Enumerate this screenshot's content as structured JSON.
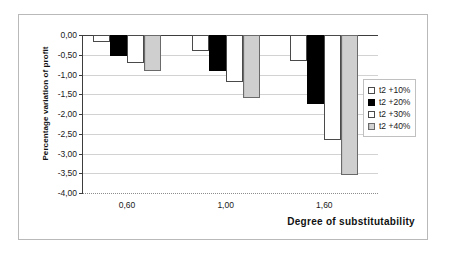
{
  "chart_data": {
    "type": "bar",
    "title": "",
    "xlabel": "Degree of substitutability",
    "ylabel": "Percentage variation of profit",
    "categories": [
      "0,60",
      "1,00",
      "1,60"
    ],
    "ylim": [
      -4.0,
      0.0
    ],
    "ytick_labels": [
      "0,00",
      "-0,50",
      "-1,00",
      "-1,50",
      "-2,00",
      "-2,50",
      "-3,00",
      "-3,50",
      "-4,00"
    ],
    "ytick_values": [
      0.0,
      -0.5,
      -1.0,
      -1.5,
      -2.0,
      -2.5,
      -3.0,
      -3.5,
      -4.0
    ],
    "grid": true,
    "legend_position": "right",
    "series": [
      {
        "name": "t2 +10%",
        "swatch": "swatch-white",
        "values": [
          -0.18,
          -0.4,
          -0.65
        ]
      },
      {
        "name": "t2 +20%",
        "swatch": "swatch-black",
        "values": [
          -0.52,
          -0.9,
          -1.75
        ]
      },
      {
        "name": "t2 +30%",
        "swatch": "swatch-white",
        "values": [
          -0.72,
          -1.2,
          -2.65
        ]
      },
      {
        "name": "t2 +40%",
        "swatch": "swatch-gray",
        "values": [
          -0.9,
          -1.6,
          -3.55
        ]
      }
    ]
  }
}
